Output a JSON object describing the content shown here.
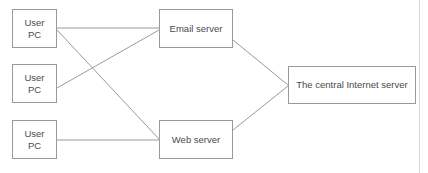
{
  "diagram": {
    "nodes": [
      {
        "id": "pc-1",
        "label": "User\nPC",
        "type": "client"
      },
      {
        "id": "pc-2",
        "label": "User\nPC",
        "type": "client"
      },
      {
        "id": "pc-3",
        "label": "User\nPC",
        "type": "client"
      },
      {
        "id": "email-server",
        "label": "Email server",
        "type": "server"
      },
      {
        "id": "web-server",
        "label": "Web server",
        "type": "server"
      },
      {
        "id": "central-server",
        "label": "The central Internet server",
        "type": "server"
      }
    ],
    "edges": [
      {
        "id": "edge-pc1-email",
        "from": "pc-1",
        "to": "email-server",
        "x1": 57,
        "y1": 28,
        "x2": 159,
        "y2": 28
      },
      {
        "id": "edge-pc1-web",
        "from": "pc-1",
        "to": "web-server",
        "x1": 57,
        "y1": 30,
        "x2": 159,
        "y2": 139
      },
      {
        "id": "edge-pc2-email",
        "from": "pc-2",
        "to": "email-server",
        "x1": 57,
        "y1": 88,
        "x2": 159,
        "y2": 30
      },
      {
        "id": "edge-pc3-web",
        "from": "pc-3",
        "to": "web-server",
        "x1": 57,
        "y1": 140,
        "x2": 159,
        "y2": 140
      },
      {
        "id": "edge-email-central",
        "from": "email-server",
        "to": "central-server",
        "x1": 233,
        "y1": 40,
        "x2": 288,
        "y2": 85
      },
      {
        "id": "edge-web-central",
        "from": "web-server",
        "to": "central-server",
        "x1": 233,
        "y1": 130,
        "x2": 288,
        "y2": 86
      }
    ],
    "style": {
      "edge_color": "#9a9a9a",
      "node_border_color": "#9a9a9a",
      "node_fill": "#ffffff",
      "text_color": "#4a4a4a",
      "canvas_background": "#ffffff"
    }
  }
}
